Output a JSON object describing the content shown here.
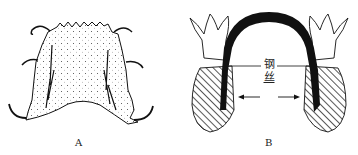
{
  "figure": {
    "panels": [
      {
        "id": "A",
        "caption": "A",
        "description": "Palatal acrylic plate with wire clasps (removable orthodontic appliance)"
      },
      {
        "id": "B",
        "caption": "B",
        "description": "Cross-section of arch with steel wire connecting teeth, arrows indicating expansion"
      }
    ],
    "labels": {
      "wire_char1": "钢",
      "wire_char2": "丝"
    }
  }
}
